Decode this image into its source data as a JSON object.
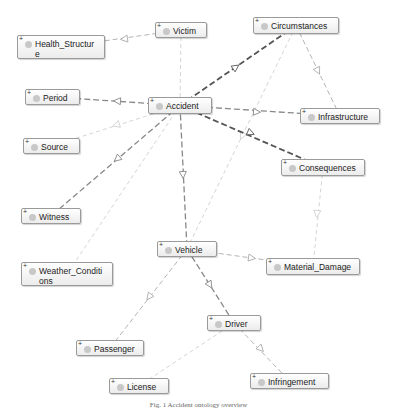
{
  "diagram": {
    "type": "ontology-class-graph",
    "nodes": [
      {
        "id": "victim",
        "label": "Victim",
        "x": 155,
        "y": 22,
        "w": 52,
        "h": 16
      },
      {
        "id": "health",
        "label": "Health_Structure",
        "line1": "Health_Structur",
        "line2": "e",
        "x": 17,
        "y": 35,
        "w": 88,
        "h": 24
      },
      {
        "id": "circumstances",
        "label": "Circumstances",
        "x": 253,
        "y": 17,
        "w": 86,
        "h": 17
      },
      {
        "id": "period",
        "label": "Period",
        "x": 25,
        "y": 89,
        "w": 55,
        "h": 16
      },
      {
        "id": "accident",
        "label": "Accident",
        "x": 148,
        "y": 97,
        "w": 64,
        "h": 17
      },
      {
        "id": "infrastructure",
        "label": "Infrastructure",
        "x": 300,
        "y": 108,
        "w": 80,
        "h": 16
      },
      {
        "id": "source",
        "label": "Source",
        "x": 23,
        "y": 138,
        "w": 57,
        "h": 16
      },
      {
        "id": "consequences",
        "label": "Consequences",
        "x": 281,
        "y": 159,
        "w": 84,
        "h": 17
      },
      {
        "id": "witness",
        "label": "Witness",
        "x": 21,
        "y": 208,
        "w": 60,
        "h": 16
      },
      {
        "id": "vehicle",
        "label": "Vehicle",
        "x": 157,
        "y": 241,
        "w": 60,
        "h": 16
      },
      {
        "id": "weather",
        "label": "Weather_Conditions",
        "line1": "Weather_Conditi",
        "line2": "ons",
        "x": 21,
        "y": 262,
        "w": 92,
        "h": 24
      },
      {
        "id": "material",
        "label": "Material_Damage",
        "x": 266,
        "y": 258,
        "w": 94,
        "h": 17
      },
      {
        "id": "driver",
        "label": "Driver",
        "x": 207,
        "y": 315,
        "w": 54,
        "h": 16
      },
      {
        "id": "passenger",
        "label": "Passenger",
        "x": 76,
        "y": 340,
        "w": 68,
        "h": 16
      },
      {
        "id": "license",
        "label": "License",
        "x": 109,
        "y": 378,
        "w": 60,
        "h": 16
      },
      {
        "id": "infringement",
        "label": "Infringement",
        "x": 250,
        "y": 373,
        "w": 79,
        "h": 16
      }
    ],
    "edges": [
      {
        "from": "victim",
        "to": "health",
        "style": "light",
        "arrow_at": [
          124,
          39
        ]
      },
      {
        "from": "victim",
        "to": "accident",
        "style": "faint"
      },
      {
        "from": "accident",
        "to": "circumstances",
        "style": "heavy",
        "arrow_at": [
          236,
          67
        ]
      },
      {
        "from": "circumstances",
        "to": "infrastructure",
        "style": "light",
        "arrow_at": [
          318,
          71
        ]
      },
      {
        "from": "circumstances",
        "to": "vehicle",
        "style": "faint",
        "arrow_at": [
          242,
          136
        ]
      },
      {
        "from": "accident",
        "to": "period",
        "style": "medium",
        "arrow_at": [
          117,
          101
        ]
      },
      {
        "from": "accident",
        "to": "infrastructure",
        "style": "medium",
        "arrow_at": [
          257,
          112
        ]
      },
      {
        "from": "accident",
        "to": "consequences",
        "style": "heavy",
        "arrow_at": [
          251,
          133
        ]
      },
      {
        "from": "accident",
        "to": "source",
        "style": "faint",
        "arrow_at": [
          116,
          125
        ]
      },
      {
        "from": "accident",
        "to": "witness",
        "style": "medium",
        "arrow_at": [
          117,
          159
        ]
      },
      {
        "from": "accident",
        "to": "weather",
        "style": "faint"
      },
      {
        "from": "accident",
        "to": "vehicle",
        "style": "medium",
        "arrow_at": [
          183,
          175
        ]
      },
      {
        "from": "consequences",
        "to": "material",
        "style": "faint",
        "arrow_at": [
          317,
          214
        ]
      },
      {
        "from": "vehicle",
        "to": "material",
        "style": "light",
        "arrow_at": [
          252,
          258
        ]
      },
      {
        "from": "vehicle",
        "to": "passenger",
        "style": "light",
        "arrow_at": [
          149,
          297
        ]
      },
      {
        "from": "vehicle",
        "to": "driver",
        "style": "medium",
        "arrow_at": [
          210,
          285
        ]
      },
      {
        "from": "driver",
        "to": "infringement",
        "style": "light",
        "arrow_at": [
          261,
          349
        ]
      },
      {
        "from": "driver",
        "to": "license",
        "style": "faint"
      }
    ]
  },
  "caption": "Fig. 1 Accident ontology overview",
  "colors": {
    "heavy_edge": "#555555",
    "medium_edge": "#888888",
    "light_edge": "#aaaaaa",
    "faint_edge": "#cfcfcf",
    "node_border": "#9a9a9a",
    "node_dot": "#c8c8c8"
  }
}
